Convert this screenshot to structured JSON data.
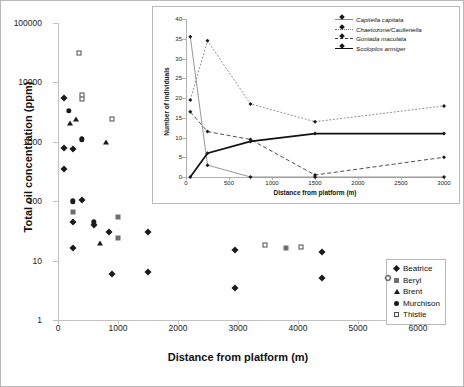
{
  "main": {
    "ylabel": "Total oil concentration (ppm)",
    "xlabel": "Distance from platform (m)",
    "yticks": [
      "1",
      "10",
      "100",
      "1000",
      "10000",
      "100000"
    ],
    "xticks": [
      "0",
      "1000",
      "2000",
      "3000",
      "4000",
      "5000",
      "6000"
    ],
    "legend": [
      {
        "label": "Beatrice",
        "marker": "diamond"
      },
      {
        "label": "Beryl",
        "marker": "square"
      },
      {
        "label": "Brent",
        "marker": "triangle"
      },
      {
        "label": "Murchison",
        "marker": "circle"
      },
      {
        "label": "Thistle",
        "marker": "open-square"
      }
    ]
  },
  "inset": {
    "ylabel": "Number of individuals",
    "xlabel": "Distance from platform (m)",
    "yticks": [
      "0",
      "5",
      "10",
      "15",
      "20",
      "25",
      "30",
      "35",
      "40"
    ],
    "xticks": [
      "0",
      "500",
      "1000",
      "1500",
      "2000",
      "2500",
      "3000"
    ],
    "legend": [
      {
        "label": "Capitella capitata",
        "style": "solid-thin"
      },
      {
        "label": "Chaetozone/Caulleriella",
        "style": "dotted"
      },
      {
        "label": "Goniada maculata",
        "style": "dashed"
      },
      {
        "label": "Scoloplos armiger",
        "style": "solid-thick"
      }
    ]
  },
  "chart_data": [
    {
      "type": "scatter",
      "title": "",
      "xlabel": "Distance from platform (m)",
      "ylabel": "Total oil concentration (ppm)",
      "xlim": [
        0,
        6000
      ],
      "ylim": [
        1,
        100000
      ],
      "yscale": "log",
      "grid": false,
      "legend_position": "bottom-right",
      "series": [
        {
          "name": "Beatrice",
          "marker": "diamond",
          "color": "#1a1a1a",
          "points": [
            [
              100,
              5500
            ],
            [
              100,
              800
            ],
            [
              100,
              350
            ],
            [
              250,
              760
            ],
            [
              250,
              45
            ],
            [
              250,
              16
            ],
            [
              400,
              105
            ],
            [
              600,
              40
            ],
            [
              850,
              30
            ],
            [
              900,
              6
            ],
            [
              1500,
              30
            ],
            [
              1500,
              6.5
            ],
            [
              2950,
              15
            ],
            [
              2950,
              3.5
            ],
            [
              4400,
              14
            ],
            [
              4400,
              5
            ],
            [
              5500,
              5
            ]
          ]
        },
        {
          "name": "Beryl",
          "marker": "square",
          "color": "#6e6e6e",
          "points": [
            [
              250,
              65
            ],
            [
              1000,
              55
            ],
            [
              1000,
              24
            ],
            [
              3800,
              16
            ]
          ]
        },
        {
          "name": "Brent",
          "marker": "triangle",
          "color": "#1a1a1a",
          "points": [
            [
              200,
              2050
            ],
            [
              300,
              2400
            ],
            [
              800,
              1000
            ],
            [
              700,
              20
            ]
          ]
        },
        {
          "name": "Murchison",
          "marker": "circle",
          "color": "#1a1a1a",
          "points": [
            [
              180,
              3300
            ],
            [
              400,
              1100
            ],
            [
              250,
              100
            ],
            [
              600,
              44
            ]
          ]
        },
        {
          "name": "Thistle",
          "marker": "open-square",
          "color": "#4a4a4a",
          "points": [
            [
              350,
              31000
            ],
            [
              400,
              6200
            ],
            [
              400,
              5200
            ],
            [
              900,
              2400
            ],
            [
              3450,
              18
            ],
            [
              4050,
              17
            ],
            [
              5500,
              5
            ]
          ]
        }
      ]
    },
    {
      "type": "line",
      "title": "",
      "xlabel": "Distance from platform (m)",
      "ylabel": "Number of individuals",
      "xlim": [
        0,
        3000
      ],
      "ylim": [
        0,
        40
      ],
      "grid": false,
      "legend_position": "top-right",
      "x": [
        50,
        250,
        750,
        1500,
        3000
      ],
      "series": [
        {
          "name": "Capitella capitata",
          "style": "solid-thin",
          "values": [
            35.5,
            3,
            0,
            0,
            0
          ]
        },
        {
          "name": "Chaetozone/Caulleriella",
          "style": "dotted",
          "values": [
            19.5,
            34.5,
            18.5,
            14,
            18
          ]
        },
        {
          "name": "Goniada maculata",
          "style": "dashed",
          "values": [
            16.5,
            11.5,
            9.5,
            0.5,
            5
          ]
        },
        {
          "name": "Scoloplos armiger",
          "style": "solid-thick",
          "values": [
            0,
            6,
            9,
            11,
            11
          ]
        }
      ]
    }
  ]
}
